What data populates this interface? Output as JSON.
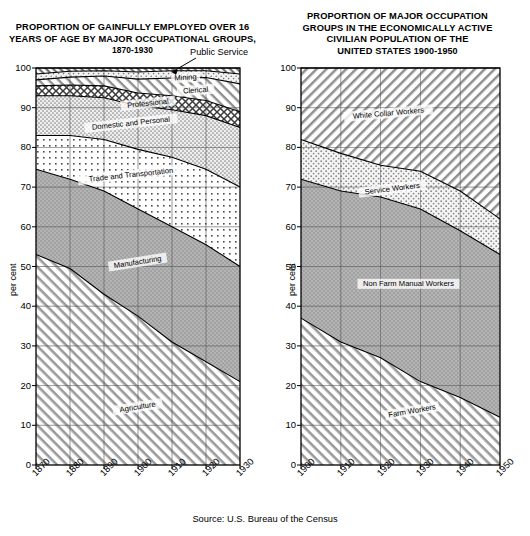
{
  "source_note": "Source: U.S. Bureau of the Census",
  "left": {
    "title_line1": "PROPORTION OF GAINFULLY EMPLOYED OVER 16",
    "title_line2": "YEARS OF AGE BY MAJOR OCCUPATIONAL GROUPS,",
    "title_line3": "1870-1930",
    "ylabel": "per cent",
    "callout": "Public Service",
    "chart_data": {
      "type": "area",
      "title": "PROPORTION OF GAINFULLY EMPLOYED OVER 16 YEARS OF AGE BY MAJOR OCCUPATIONAL GROUPS, 1870-1930",
      "xlabel": "",
      "ylabel": "per cent",
      "ylim": [
        0,
        100
      ],
      "xlim": [
        1870,
        1930
      ],
      "grid": true,
      "legend": "inline-band-labels",
      "x": [
        1870,
        1880,
        1890,
        1900,
        1910,
        1920,
        1930
      ],
      "xticklabels": [
        "1870",
        "1880",
        "1890",
        "1900",
        "1910",
        "1920",
        "1930"
      ],
      "yticklabels": [
        "0",
        "10",
        "20",
        "30",
        "40",
        "50",
        "60",
        "70",
        "80",
        "90",
        "100"
      ],
      "series": [
        {
          "name": "Agriculture",
          "values": [
            53.0,
            49.5,
            43.0,
            37.5,
            31.0,
            26.0,
            21.0
          ]
        },
        {
          "name": "Manufacturing",
          "values": [
            21.5,
            22.5,
            26.0,
            27.0,
            29.0,
            29.5,
            29.0
          ]
        },
        {
          "name": "Trade and Transportation",
          "values": [
            8.5,
            11.0,
            13.0,
            15.0,
            17.5,
            19.0,
            20.0
          ]
        },
        {
          "name": "Domestic and Personal",
          "values": [
            10.0,
            10.0,
            10.5,
            11.0,
            12.0,
            13.5,
            15.0
          ]
        },
        {
          "name": "Professional",
          "values": [
            2.5,
            2.7,
            3.0,
            3.2,
            3.5,
            3.8,
            4.0
          ]
        },
        {
          "name": "Clerical",
          "values": [
            1.5,
            2.0,
            2.5,
            3.5,
            4.5,
            5.8,
            7.0
          ]
        },
        {
          "name": "Mining",
          "values": [
            1.5,
            1.5,
            1.3,
            1.8,
            1.8,
            1.7,
            2.5
          ]
        },
        {
          "name": "Public Service",
          "values": [
            1.5,
            0.8,
            0.7,
            1.0,
            0.7,
            1.2,
            1.5
          ]
        }
      ],
      "cumulative_tops": {
        "Agriculture": [
          53.0,
          49.5,
          43.0,
          37.5,
          31.0,
          26.0,
          21.0
        ],
        "Manufacturing": [
          74.5,
          72.0,
          69.0,
          64.5,
          60.0,
          55.5,
          50.0
        ],
        "Trade and Transportation": [
          83.0,
          83.0,
          82.0,
          79.5,
          77.5,
          74.5,
          70.0
        ],
        "Domestic and Personal": [
          93.0,
          93.0,
          92.5,
          90.5,
          89.5,
          88.0,
          85.0
        ],
        "Professional": [
          95.5,
          95.7,
          95.5,
          93.7,
          93.0,
          91.8,
          89.0
        ],
        "Clerical": [
          97.0,
          97.7,
          98.0,
          97.2,
          97.5,
          97.6,
          96.0
        ],
        "Mining": [
          98.5,
          99.2,
          99.3,
          99.0,
          99.3,
          99.3,
          98.5
        ],
        "Public Service": [
          100,
          100,
          100,
          100,
          100,
          100,
          100
        ]
      }
    }
  },
  "right": {
    "title_line1": "PROPORTION OF MAJOR OCCUPATION",
    "title_line2": "GROUPS IN THE ECONOMICALLY ACTIVE",
    "title_line3": "CIVILIAN POPULATION OF THE",
    "title_line4": "UNITED STATES",
    "title_years": "1900-1950",
    "ylabel": "per cent",
    "chart_data": {
      "type": "area",
      "title": "PROPORTION OF MAJOR OCCUPATION GROUPS IN THE ECONOMICALLY ACTIVE CIVILIAN POPULATION OF THE UNITED STATES 1900-1950",
      "xlabel": "",
      "ylabel": "per cent",
      "ylim": [
        0,
        100
      ],
      "xlim": [
        1900,
        1950
      ],
      "grid": true,
      "legend": "inline-band-labels",
      "x": [
        1900,
        1910,
        1920,
        1930,
        1940,
        1950
      ],
      "xticklabels": [
        "1900",
        "1910",
        "1920",
        "1930",
        "1940",
        "1950"
      ],
      "yticklabels": [
        "0",
        "10",
        "20",
        "30",
        "40",
        "50",
        "60",
        "70",
        "80",
        "90",
        "100"
      ],
      "series": [
        {
          "name": "Farm Workers",
          "values": [
            37.0,
            31.0,
            27.0,
            21.0,
            17.0,
            12.0
          ]
        },
        {
          "name": "Non Farm Manual Workers",
          "values": [
            35.0,
            38.0,
            40.5,
            43.5,
            42.0,
            41.0
          ]
        },
        {
          "name": "Service Workers",
          "values": [
            10.0,
            9.5,
            8.0,
            9.5,
            10.0,
            9.0
          ]
        },
        {
          "name": "White Collar Workers",
          "values": [
            18.0,
            21.5,
            24.5,
            26.0,
            31.0,
            38.0
          ]
        }
      ],
      "cumulative_tops": {
        "Farm Workers": [
          37.0,
          31.0,
          27.0,
          21.0,
          17.0,
          12.0
        ],
        "Non Farm Manual Workers": [
          72.0,
          69.0,
          67.5,
          64.5,
          59.0,
          53.0
        ],
        "Service Workers": [
          82.0,
          78.5,
          75.5,
          74.0,
          69.0,
          62.0
        ],
        "White Collar Workers": [
          100,
          100,
          100,
          100,
          100,
          100
        ]
      }
    }
  }
}
